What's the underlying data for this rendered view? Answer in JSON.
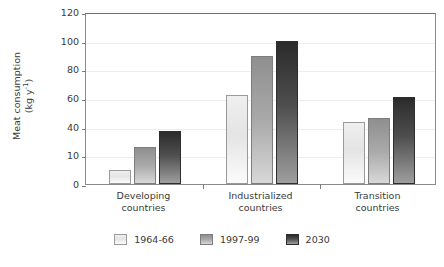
{
  "chart_data": {
    "type": "bar",
    "title": "",
    "xlabel": "",
    "ylabel_line1": "Meat consumption",
    "ylabel_line2_prefix": "(kg y",
    "ylabel_line2_sup": "-1",
    "ylabel_line2_suffix": ")",
    "categories": [
      "Developing\ncountries",
      "Industrialized\ncountries",
      "Transition\ncountries"
    ],
    "category_labels": [
      {
        "line1": "Developing",
        "line2": "countries"
      },
      {
        "line1": "Industrialized",
        "line2": "countries"
      },
      {
        "line1": "Transition",
        "line2": "countries"
      }
    ],
    "series": [
      {
        "name": "1964-66",
        "values": [
          10,
          26,
          37
        ]
      },
      {
        "name": "1997-99",
        "values": [
          62,
          89,
          100
        ]
      },
      {
        "name": "2030",
        "values": [
          43,
          46,
          61
        ]
      }
    ],
    "series_by_group": [
      {
        "category": "Developing countries",
        "values": [
          10,
          26,
          37
        ]
      },
      {
        "category": "Industrialized countries",
        "values": [
          62,
          89,
          100
        ]
      },
      {
        "category": "Transition countries",
        "values": [
          43,
          46,
          61
        ]
      }
    ],
    "legend": [
      {
        "label": "1964-66",
        "color": "#e4e4e4"
      },
      {
        "label": "1997-99",
        "color": "#a9a9a9"
      },
      {
        "label": "2030",
        "color": "#3a3a3a"
      }
    ],
    "ylim": [
      0,
      120
    ],
    "ytick_labels": [
      "0",
      "10",
      "40",
      "60",
      "80",
      "100",
      "120"
    ],
    "ytick_values": [
      0,
      20,
      40,
      60,
      80,
      100,
      120
    ],
    "grid": true,
    "legend_position": "bottom"
  }
}
